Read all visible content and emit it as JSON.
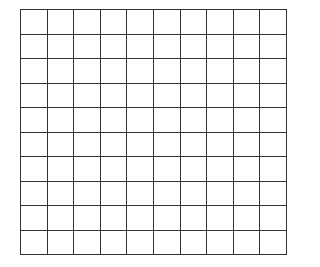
{
  "grid": {
    "rows": 10,
    "columns": 10,
    "line_color": "#333333",
    "background": "#ffffff",
    "cells": [
      [
        "",
        "",
        "",
        "",
        "",
        "",
        "",
        "",
        "",
        ""
      ],
      [
        "",
        "",
        "",
        "",
        "",
        "",
        "",
        "",
        "",
        ""
      ],
      [
        "",
        "",
        "",
        "",
        "",
        "",
        "",
        "",
        "",
        ""
      ],
      [
        "",
        "",
        "",
        "",
        "",
        "",
        "",
        "",
        "",
        ""
      ],
      [
        "",
        "",
        "",
        "",
        "",
        "",
        "",
        "",
        "",
        ""
      ],
      [
        "",
        "",
        "",
        "",
        "",
        "",
        "",
        "",
        "",
        ""
      ],
      [
        "",
        "",
        "",
        "",
        "",
        "",
        "",
        "",
        "",
        ""
      ],
      [
        "",
        "",
        "",
        "",
        "",
        "",
        "",
        "",
        "",
        ""
      ],
      [
        "",
        "",
        "",
        "",
        "",
        "",
        "",
        "",
        "",
        ""
      ],
      [
        "",
        "",
        "",
        "",
        "",
        "",
        "",
        "",
        "",
        ""
      ]
    ]
  }
}
